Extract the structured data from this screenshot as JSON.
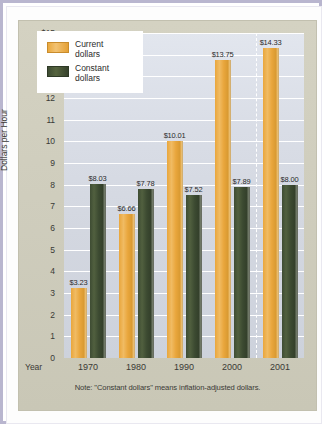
{
  "chart_data": {
    "type": "bar",
    "title": "",
    "xlabel": "Year",
    "ylabel": "Dollars per Hour",
    "categories": [
      "1970",
      "1980",
      "1990",
      "2000",
      "2001"
    ],
    "series": [
      {
        "name": "Current dollars",
        "color": "#e9a63c",
        "values": [
          3.23,
          6.66,
          10.01,
          13.75,
          14.33
        ],
        "labels": [
          "$3.23",
          "$6.66",
          "$10.01",
          "$13.75",
          "$14.33"
        ]
      },
      {
        "name": "Constant dollars",
        "color": "#3e4c33",
        "values": [
          8.03,
          7.78,
          7.52,
          7.89,
          8.0
        ],
        "labels": [
          "$8.03",
          "$7.78",
          "$7.52",
          "$7.89",
          "$8.00"
        ]
      }
    ],
    "ylim": [
      0,
      15
    ],
    "yticks": [
      "$15",
      "14",
      "13",
      "12",
      "11",
      "10",
      "9",
      "8",
      "7",
      "6",
      "5",
      "4",
      "3",
      "2",
      "1",
      "0"
    ],
    "ytick_values": [
      15,
      14,
      13,
      12,
      11,
      10,
      9,
      8,
      7,
      6,
      5,
      4,
      3,
      2,
      1,
      0
    ],
    "grid": true,
    "legend_position": "top-left",
    "annotations": [
      "Note:  \"Constant dollars\" means inflation-adjusted dollars."
    ]
  },
  "legend": {
    "items": [
      {
        "label_line1": "Current",
        "label_line2": "dollars"
      },
      {
        "label_line1": "Constant",
        "label_line2": "dollars"
      }
    ]
  },
  "axis": {
    "x_title": "Year",
    "y_title": "Dollars per Hour"
  },
  "note": {
    "text": "Note:  \"Constant dollars\" means inflation-adjusted dollars."
  },
  "colors": {
    "current_dollars": "#e9a63c",
    "constant_dollars": "#3e4c33",
    "panel_background": "#cfcdbd",
    "plot_background": "#d9dde6",
    "frame": "#b9b6cf"
  }
}
